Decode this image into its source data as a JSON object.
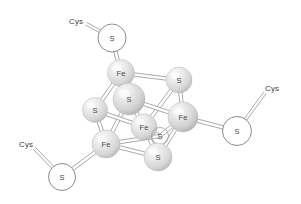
{
  "figure": {
    "name": "iron-sulfur-cluster",
    "background_color": "#ffffff",
    "width": 301,
    "height": 204
  },
  "style": {
    "sphere_base_color": "#d8d8d8",
    "sphere_highlight_color": "#f4f4f4",
    "sphere_shadow_color": "#a8a8a8",
    "bond_stroke_color": "#8d8d8d",
    "open_circle_fill": "#ffffff",
    "open_circle_stroke": "#6f6f6f",
    "label_color": "#4a4a4a",
    "ligand_label_color": "#3c3c3c"
  },
  "atoms": [
    {
      "id": "s-cys-top",
      "label": "S",
      "kind": "open",
      "x": 112,
      "y": 38,
      "r": 14
    },
    {
      "id": "fe-top",
      "label": "Fe",
      "kind": "sphere",
      "x": 121,
      "y": 73,
      "r": 13.5
    },
    {
      "id": "s-right-top",
      "label": "S",
      "kind": "sphere",
      "x": 179,
      "y": 80,
      "r": 13
    },
    {
      "id": "s-center",
      "label": "S",
      "kind": "sphere",
      "x": 129,
      "y": 99,
      "r": 16
    },
    {
      "id": "s-left",
      "label": "S",
      "kind": "sphere",
      "x": 95,
      "y": 110,
      "r": 12.5
    },
    {
      "id": "fe-right",
      "label": "Fe",
      "kind": "sphere",
      "x": 183,
      "y": 117,
      "r": 15
    },
    {
      "id": "fe-center",
      "label": "Fe",
      "kind": "sphere",
      "x": 144,
      "y": 127,
      "r": 13
    },
    {
      "id": "s-hidden",
      "label": "S",
      "kind": "hidden",
      "x": 160,
      "y": 136,
      "r": 8.5
    },
    {
      "id": "s-cys-right",
      "label": "S",
      "kind": "open",
      "x": 237,
      "y": 131,
      "r": 14.5
    },
    {
      "id": "fe-bottom",
      "label": "Fe",
      "kind": "sphere",
      "x": 106,
      "y": 144,
      "r": 14
    },
    {
      "id": "s-bottom",
      "label": "S",
      "kind": "sphere",
      "x": 158,
      "y": 157,
      "r": 14
    },
    {
      "id": "s-cys-bottom",
      "label": "S",
      "kind": "open",
      "x": 62,
      "y": 177,
      "r": 13.5
    }
  ],
  "ligands": [
    {
      "id": "cys-top",
      "label": "Cys",
      "x": 76,
      "y": 21,
      "to": "s-cys-top"
    },
    {
      "id": "cys-right",
      "label": "Cys",
      "x": 272,
      "y": 88,
      "to": "s-cys-right"
    },
    {
      "id": "cys-bottom",
      "label": "Cys",
      "x": 26,
      "y": 144,
      "to": "s-cys-bottom"
    }
  ],
  "bonds": [
    {
      "from": "s-cys-top",
      "to": "fe-top"
    },
    {
      "from": "fe-top",
      "to": "s-right-top"
    },
    {
      "from": "fe-top",
      "to": "s-center"
    },
    {
      "from": "fe-top",
      "to": "s-left"
    },
    {
      "from": "s-right-top",
      "to": "fe-right"
    },
    {
      "from": "s-right-top",
      "to": "fe-center"
    },
    {
      "from": "s-center",
      "to": "fe-right"
    },
    {
      "from": "s-center",
      "to": "fe-center"
    },
    {
      "from": "s-center",
      "to": "fe-bottom"
    },
    {
      "from": "s-left",
      "to": "fe-bottom"
    },
    {
      "from": "s-left",
      "to": "fe-center"
    },
    {
      "from": "fe-right",
      "to": "s-cys-right"
    },
    {
      "from": "fe-right",
      "to": "s-hidden"
    },
    {
      "from": "fe-right",
      "to": "s-bottom"
    },
    {
      "from": "fe-center",
      "to": "s-hidden"
    },
    {
      "from": "fe-center",
      "to": "s-bottom"
    },
    {
      "from": "fe-bottom",
      "to": "s-bottom"
    },
    {
      "from": "fe-bottom",
      "to": "s-hidden"
    },
    {
      "from": "fe-bottom",
      "to": "s-cys-bottom"
    }
  ],
  "ligand_bonds": [
    {
      "from": "cys-top",
      "to": "s-cys-top"
    },
    {
      "from": "cys-right",
      "to": "s-cys-right"
    },
    {
      "from": "cys-bottom",
      "to": "s-cys-bottom"
    }
  ]
}
